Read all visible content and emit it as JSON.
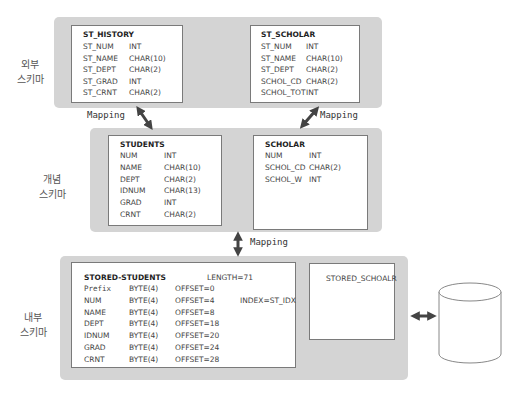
{
  "levels": {
    "external": "외부\n스키마",
    "conceptual": "개념\n스키마",
    "internal": "내부\n스키마"
  },
  "mapping_label": "Mapping",
  "external_schema": [
    {
      "name": "ST_HISTORY",
      "fields": [
        {
          "name": "ST_NUM",
          "type": "INT"
        },
        {
          "name": "ST_NAME",
          "type": "CHAR(10)"
        },
        {
          "name": "ST_DEPT",
          "type": "CHAR(2)"
        },
        {
          "name": "ST_GRAD",
          "type": "INT"
        },
        {
          "name": "ST_CRNT",
          "type": "CHAR(2)"
        }
      ]
    },
    {
      "name": "ST_SCHOLAR",
      "fields": [
        {
          "name": "ST_NUM",
          "type": "INT"
        },
        {
          "name": "ST_NAME",
          "type": "CHAR(10)"
        },
        {
          "name": "ST_DEPT",
          "type": "CHAR(2)"
        },
        {
          "name": "SCHOL_CD",
          "type": "CHAR(2)"
        },
        {
          "name": "SCHOL_TOT",
          "type": "INT"
        }
      ]
    }
  ],
  "conceptual_schema": [
    {
      "name": "STUDENTS",
      "fields": [
        {
          "name": "NUM",
          "type": "INT"
        },
        {
          "name": "NAME",
          "type": "CHAR(10)"
        },
        {
          "name": "DEPT",
          "type": "CHAR(2)"
        },
        {
          "name": "IDNUM",
          "type": "CHAR(13)"
        },
        {
          "name": "GRAD",
          "type": "INT"
        },
        {
          "name": "CRNT",
          "type": "CHAR(2)"
        }
      ]
    },
    {
      "name": "SCHOLAR",
      "fields": [
        {
          "name": "NUM",
          "type": "INT"
        },
        {
          "name": "SCHOL_CD",
          "type": "CHAR(2)"
        },
        {
          "name": "SCHOL_W",
          "type": "INT"
        }
      ]
    }
  ],
  "internal_schema": {
    "stored_students": {
      "name": "STORED-STUDENTS",
      "length": "LENGTH=71",
      "index": "INDEX=ST_IDX",
      "fields": [
        {
          "name": "Prefix",
          "type": "BYTE(4)",
          "offset": "OFFSET=0"
        },
        {
          "name": "NUM",
          "type": "BYTE(4)",
          "offset": "OFFSET=4"
        },
        {
          "name": "NAME",
          "type": "BYTE(4)",
          "offset": "OFFSET=8"
        },
        {
          "name": "DEPT",
          "type": "BYTE(4)",
          "offset": "OFFSET=18"
        },
        {
          "name": "IDNUM",
          "type": "BYTE(4)",
          "offset": "OFFSET=20"
        },
        {
          "name": "GRAD",
          "type": "BYTE(4)",
          "offset": "OFFSET=24"
        },
        {
          "name": "CRNT",
          "type": "BYTE(4)",
          "offset": "OFFSET=28"
        }
      ]
    },
    "stored_scholar": {
      "name": "STORED_SCHOALR"
    }
  },
  "colors": {
    "panel": "#d4d4d4",
    "box_border": "#7a7a7a",
    "arrow": "#444444"
  }
}
